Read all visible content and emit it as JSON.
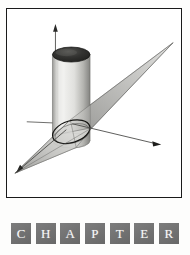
{
  "page": {
    "background_color": "#fdfdfc",
    "width": 190,
    "height": 255
  },
  "figure": {
    "name": "cylinder-plane-intersection",
    "caption": "",
    "frame": {
      "border_color": "#1a1a1a",
      "background_color": "#ffffff"
    },
    "colors": {
      "axis": "#4a4a4a",
      "cylinder_light": "#e8e8e6",
      "cylinder_mid": "#c8c8c6",
      "cylinder_dark": "#8a8a88",
      "cylinder_cap_dark": "#2a2a2a",
      "cylinder_cap_light": "#6a6a68",
      "plane_fill": "#b9b9b6",
      "plane_edge": "#5a5a58",
      "intersection_curve": "#1a1a1a"
    },
    "elements": {
      "z_axis_label": "z-axis",
      "x_axis_label": "x-axis",
      "y_axis_label": "y-axis",
      "cylinder_label": "cylinder",
      "plane_label": "cutting plane",
      "intersection_label": "ellipse of intersection"
    }
  },
  "chapter": {
    "word": "CHAPTER",
    "letters": [
      "C",
      "H",
      "A",
      "P",
      "T",
      "E",
      "R"
    ],
    "tile_color": "#6e6e6e",
    "letter_color": "#ffffff"
  }
}
